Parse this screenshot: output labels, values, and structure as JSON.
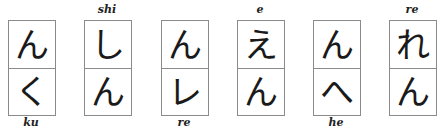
{
  "pairs": [
    {
      "top": "ん",
      "bottom": "く",
      "label": "ku",
      "label_position": "below",
      "x": 8
    },
    {
      "top": "し",
      "bottom": "ん",
      "label": "shi",
      "label_position": "above",
      "x": 84
    },
    {
      "top": "ん",
      "bottom": "レ",
      "label": "re",
      "label_position": "below",
      "x": 161
    },
    {
      "top": "え",
      "bottom": "ん",
      "label": "e",
      "label_position": "above",
      "x": 237
    },
    {
      "top": "ん",
      "bottom": "へ",
      "label": "he",
      "label_position": "below",
      "x": 313
    },
    {
      "top": "れ",
      "bottom": "ん",
      "label": "re",
      "label_position": "above",
      "x": 389
    }
  ]
}
